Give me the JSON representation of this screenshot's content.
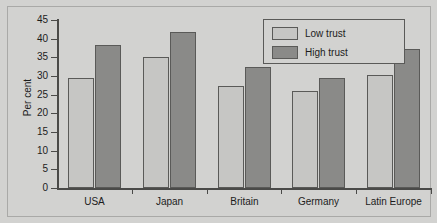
{
  "chart_data": {
    "type": "bar",
    "title": "",
    "xlabel": "",
    "ylabel": "Per cent",
    "ylim": [
      0,
      45
    ],
    "yticks": [
      0,
      5,
      10,
      15,
      20,
      25,
      30,
      35,
      40,
      45
    ],
    "ytick_labels": [
      "0",
      "5",
      "10",
      "15",
      "20",
      "25",
      "30",
      "35",
      "40",
      "45"
    ],
    "grid": false,
    "legend_position": "top-right",
    "categories": [
      "USA",
      "Japan",
      "Britain",
      "Germany",
      "Latin Europe"
    ],
    "series": [
      {
        "name": "Low trust",
        "color": "#c6c6c4",
        "values": [
          29.5,
          35.1,
          27.3,
          26.1,
          30.2
        ]
      },
      {
        "name": "High trust",
        "color": "#8a8a88",
        "values": [
          38.4,
          41.7,
          32.3,
          29.5,
          37.1
        ]
      }
    ]
  },
  "legend": {
    "entries": [
      {
        "label": "Low trust",
        "swatch": "low"
      },
      {
        "label": "High trust",
        "swatch": "high"
      }
    ]
  },
  "axes": {
    "y_axis_title": "Per cent"
  },
  "colors": {
    "background": "#d2d2d0",
    "axis": "#4a4a48",
    "bar_low": "#c6c6c4",
    "bar_high": "#8a8a88",
    "bar_outline": "#5a5a58",
    "text": "#1c1c1c"
  }
}
